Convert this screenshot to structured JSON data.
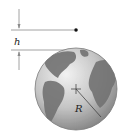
{
  "diagram": {
    "labels": {
      "height": "h",
      "radius": "R"
    },
    "colors": {
      "line": "#8a8a8a",
      "dot": "#111111",
      "ocean_light": "#e6e6e6",
      "ocean_dark": "#8c8c8c",
      "land": "#6e6e6e",
      "outline": "#7a7a7a"
    },
    "elements": [
      "height-dimension-arrows",
      "reference-line-top",
      "reference-line-surface",
      "satellite-point",
      "earth-globe",
      "center-crosshair",
      "radius-line"
    ]
  }
}
